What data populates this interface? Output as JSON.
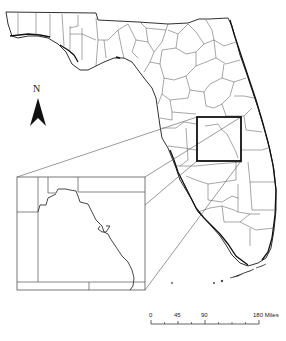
{
  "map": {
    "title": "",
    "region": "Florida",
    "description": "County map of Florida with a study area box in central Florida and an enlarged inset",
    "colors": {
      "background": "#ffffff",
      "outline": "#1a1a1a",
      "county_lines": "#3a3a3a",
      "study_box": "#111111",
      "leader_lines": "#555555"
    }
  },
  "north_arrow": {
    "label": "N",
    "icon": "north-arrow-icon"
  },
  "scale_bar": {
    "ticks": [
      "0",
      "45",
      "90",
      "180"
    ],
    "units": "Miles",
    "label_180_units": "180 Miles"
  },
  "study_area": {
    "label": "",
    "box_px": {
      "x": 197,
      "y": 117,
      "w": 44,
      "h": 44
    }
  },
  "inset": {
    "label": "",
    "frame_px": {
      "x": 17,
      "y": 177,
      "w": 128,
      "h": 113
    }
  }
}
